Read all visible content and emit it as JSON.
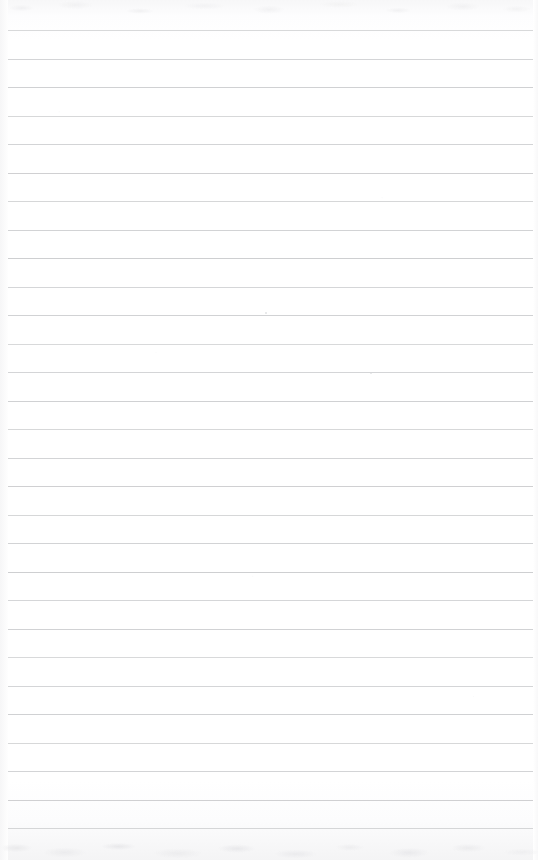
{
  "document": {
    "kind": "scanned-ruled-notepad-page",
    "title": "Blank Ruled Notebook Page",
    "page_width": 538,
    "page_height": 860,
    "written_text": "",
    "text_lines": [],
    "status_note": ""
  },
  "paper": {
    "background_color": "#ffffff",
    "tint_color": "#fdfdfe",
    "edge_shadow_color": "#f4f4f5",
    "noise_color": "#e8e8ea"
  },
  "ruling": {
    "line_color": "#c9cacc",
    "line_thickness_px": 1,
    "line_spacing_px": 28.5,
    "first_line_y": 30,
    "line_left_x": 8,
    "line_right_x": 533,
    "line_count": 29,
    "line_y_positions": [
      30,
      58.5,
      87,
      115.5,
      144,
      172.5,
      201,
      229.5,
      258,
      286.5,
      315,
      343.5,
      372,
      400.5,
      429,
      457.5,
      486,
      514.5,
      543,
      571.5,
      600,
      628.5,
      657,
      685.5,
      714,
      742.5,
      771,
      799.5,
      828
    ]
  },
  "marks": {
    "specks": [
      {
        "x": 265,
        "y": 312,
        "size": 2
      },
      {
        "x": 370,
        "y": 372,
        "size": 2
      }
    ]
  }
}
